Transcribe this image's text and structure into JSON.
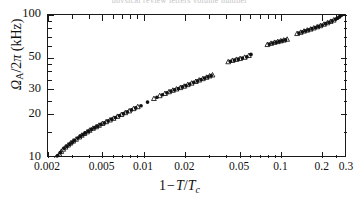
{
  "figure": {
    "top_caption_remnant": "physical review letters   volume  number",
    "background_color": "#ffffff",
    "axis_color": "#1a1a1a",
    "marker_color": "#111111"
  },
  "axes": {
    "x_title_parts": {
      "one": "1",
      "minus": "−",
      "t": "T",
      "slash": "/",
      "tc": "T",
      "tc_sub": "c"
    },
    "y_title_parts": {
      "omega": "Ω",
      "omega_sub": "A",
      "over": "/2",
      "pi": "π",
      "unit": " (kHz)"
    },
    "x_tick_labels": [
      "0.002",
      "0.005",
      "0.01",
      "0.02",
      "0.05",
      "0.1",
      "0.2",
      "0.3"
    ],
    "y_tick_labels": [
      "10",
      "20",
      "30",
      "50",
      "100"
    ]
  },
  "chart_data": {
    "type": "scatter",
    "title": "",
    "subtitle": "",
    "xlabel": "1−T/T_c",
    "ylabel": "Ω_A/2π (kHz)",
    "xscale": "log",
    "yscale": "log",
    "xlim": [
      0.002,
      0.3
    ],
    "ylim": [
      10,
      100
    ],
    "grid": false,
    "legend": false,
    "x_ticks": [
      0.002,
      0.005,
      0.01,
      0.02,
      0.05,
      0.1,
      0.2,
      0.3
    ],
    "y_ticks": [
      10,
      20,
      30,
      50,
      100
    ],
    "x_minor_ticks": [
      0.003,
      0.004,
      0.006,
      0.007,
      0.008,
      0.009,
      0.03,
      0.04,
      0.06,
      0.07,
      0.08,
      0.09,
      0.25
    ],
    "y_minor_ticks": [
      15,
      25,
      35,
      40,
      45,
      60,
      70,
      80,
      90
    ],
    "annotations": [],
    "series": [
      {
        "name": "open-triangle",
        "marker": "triangle-up-open",
        "points": [
          [
            0.00228,
            10.0
          ],
          [
            0.00242,
            10.6
          ],
          [
            0.0025,
            11.1
          ],
          [
            0.00258,
            11.5
          ],
          [
            0.00268,
            11.9
          ],
          [
            0.0028,
            12.3
          ],
          [
            0.00292,
            12.7
          ],
          [
            0.00305,
            13.1
          ],
          [
            0.0032,
            13.5
          ],
          [
            0.00338,
            14.0
          ],
          [
            0.00352,
            14.4
          ],
          [
            0.00368,
            14.8
          ],
          [
            0.00385,
            15.2
          ],
          [
            0.00402,
            15.6
          ],
          [
            0.00425,
            16.1
          ],
          [
            0.00448,
            16.5
          ],
          [
            0.0047,
            16.9
          ],
          [
            0.00498,
            17.4
          ],
          [
            0.0053,
            17.9
          ],
          [
            0.00565,
            18.4
          ],
          [
            0.006,
            18.9
          ],
          [
            0.0064,
            19.5
          ],
          [
            0.00685,
            20.1
          ],
          [
            0.0073,
            20.7
          ],
          [
            0.0078,
            21.3
          ],
          [
            0.0084,
            22.1
          ],
          [
            0.009,
            22.8
          ],
          [
            0.0118,
            26.0
          ],
          [
            0.013,
            27.2
          ],
          [
            0.0142,
            28.2
          ],
          [
            0.0152,
            29.0
          ],
          [
            0.0162,
            29.7
          ],
          [
            0.0172,
            30.3
          ],
          [
            0.0184,
            31.0
          ],
          [
            0.0196,
            31.7
          ],
          [
            0.0208,
            32.5
          ],
          [
            0.0222,
            33.3
          ],
          [
            0.0238,
            34.2
          ],
          [
            0.0252,
            35.0
          ],
          [
            0.0268,
            35.8
          ],
          [
            0.0285,
            36.6
          ],
          [
            0.03,
            37.4
          ],
          [
            0.0315,
            38.0
          ],
          [
            0.041,
            47.0
          ],
          [
            0.044,
            48.0
          ],
          [
            0.047,
            48.8
          ],
          [
            0.05,
            49.5
          ],
          [
            0.054,
            50.5
          ],
          [
            0.058,
            52.0
          ],
          [
            0.079,
            62.0
          ],
          [
            0.084,
            63.2
          ],
          [
            0.089,
            64.2
          ],
          [
            0.094,
            65.0
          ],
          [
            0.099,
            65.8
          ],
          [
            0.104,
            66.6
          ],
          [
            0.11,
            67.5
          ],
          [
            0.13,
            74.0
          ],
          [
            0.138,
            75.5
          ],
          [
            0.146,
            77.0
          ],
          [
            0.154,
            78.2
          ],
          [
            0.163,
            79.5
          ],
          [
            0.172,
            81.0
          ],
          [
            0.182,
            82.5
          ],
          [
            0.192,
            84.0
          ],
          [
            0.204,
            86.0
          ],
          [
            0.216,
            88.0
          ],
          [
            0.228,
            90.0
          ],
          [
            0.24,
            92.0
          ]
        ]
      },
      {
        "name": "filled-circle",
        "marker": "circle-filled",
        "points": [
          [
            0.00235,
            10.4
          ],
          [
            0.00246,
            10.9
          ],
          [
            0.00262,
            11.7
          ],
          [
            0.00275,
            12.1
          ],
          [
            0.00288,
            12.5
          ],
          [
            0.003,
            12.9
          ],
          [
            0.00312,
            13.3
          ],
          [
            0.0033,
            13.8
          ],
          [
            0.00345,
            14.2
          ],
          [
            0.0036,
            14.6
          ],
          [
            0.00375,
            15.0
          ],
          [
            0.00395,
            15.4
          ],
          [
            0.00415,
            15.9
          ],
          [
            0.00438,
            16.3
          ],
          [
            0.0046,
            16.7
          ],
          [
            0.00485,
            17.2
          ],
          [
            0.00515,
            17.6
          ],
          [
            0.00548,
            18.2
          ],
          [
            0.00582,
            18.7
          ],
          [
            0.0062,
            19.2
          ],
          [
            0.00662,
            19.8
          ],
          [
            0.00708,
            20.4
          ],
          [
            0.00755,
            21.0
          ],
          [
            0.0081,
            21.7
          ],
          [
            0.0087,
            22.4
          ],
          [
            0.0095,
            23.2
          ],
          [
            0.0106,
            24.6
          ],
          [
            0.0124,
            26.6
          ],
          [
            0.0136,
            27.7
          ],
          [
            0.0147,
            28.6
          ],
          [
            0.0157,
            29.4
          ],
          [
            0.0167,
            30.0
          ],
          [
            0.0178,
            30.6
          ],
          [
            0.019,
            31.4
          ],
          [
            0.0202,
            32.1
          ],
          [
            0.0215,
            32.9
          ],
          [
            0.023,
            33.8
          ],
          [
            0.0245,
            34.6
          ],
          [
            0.026,
            35.4
          ],
          [
            0.0276,
            36.2
          ],
          [
            0.0292,
            37.0
          ],
          [
            0.0308,
            37.7
          ],
          [
            0.0425,
            47.5
          ],
          [
            0.0455,
            48.4
          ],
          [
            0.0485,
            49.2
          ],
          [
            0.052,
            50.0
          ],
          [
            0.056,
            51.0
          ],
          [
            0.06,
            53.0
          ],
          [
            0.0815,
            62.6
          ],
          [
            0.0865,
            63.7
          ],
          [
            0.0915,
            64.6
          ],
          [
            0.0965,
            65.4
          ],
          [
            0.1015,
            66.2
          ],
          [
            0.107,
            67.0
          ],
          [
            0.134,
            74.8
          ],
          [
            0.142,
            76.3
          ],
          [
            0.15,
            77.6
          ],
          [
            0.158,
            78.8
          ],
          [
            0.167,
            80.2
          ],
          [
            0.177,
            81.8
          ],
          [
            0.187,
            83.2
          ],
          [
            0.198,
            85.0
          ],
          [
            0.21,
            87.0
          ],
          [
            0.222,
            89.0
          ],
          [
            0.234,
            91.0
          ],
          [
            0.248,
            93.5
          ],
          [
            0.256,
            95.0
          ],
          [
            0.264,
            97.0
          ],
          [
            0.27,
            99.0
          ],
          [
            0.274,
            100.0
          ]
        ]
      }
    ]
  }
}
